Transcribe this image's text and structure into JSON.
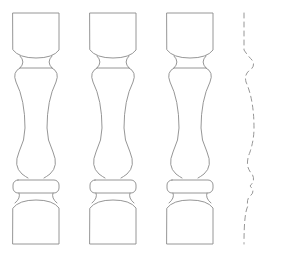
{
  "figure": {
    "line_color": "#8a8a8a",
    "background": "#ffffff",
    "balusters": [
      {
        "id": "baluster-1",
        "x": 13
      },
      {
        "id": "baluster-2",
        "x": 90
      },
      {
        "id": "baluster-3",
        "x": 167
      }
    ],
    "profile_label": "half-profile (dashed)"
  }
}
